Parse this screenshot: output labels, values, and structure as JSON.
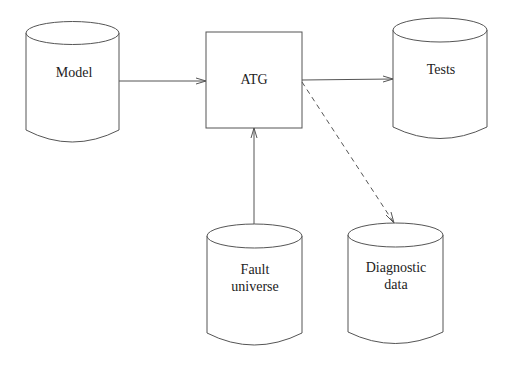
{
  "diagram": {
    "type": "flow-diagram",
    "nodes": [
      {
        "id": "model",
        "shape": "cylinder",
        "lines": [
          "Model"
        ]
      },
      {
        "id": "atg",
        "shape": "rectangle",
        "lines": [
          "ATG"
        ]
      },
      {
        "id": "tests",
        "shape": "cylinder",
        "lines": [
          "Tests"
        ]
      },
      {
        "id": "fault_universe",
        "shape": "cylinder",
        "lines": [
          "Fault",
          "universe"
        ]
      },
      {
        "id": "diagnostic_data",
        "shape": "cylinder",
        "lines": [
          "Diagnostic",
          "data"
        ]
      }
    ],
    "edges": [
      {
        "from": "model",
        "to": "atg",
        "style": "solid"
      },
      {
        "from": "atg",
        "to": "tests",
        "style": "solid"
      },
      {
        "from": "fault_universe",
        "to": "atg",
        "style": "solid"
      },
      {
        "from": "atg",
        "to": "diagnostic_data",
        "style": "dashed"
      }
    ],
    "colors": {
      "stroke": "#555555",
      "text": "#222222",
      "background": "#ffffff"
    }
  },
  "labels": {
    "model": "Model",
    "atg": "ATG",
    "tests": "Tests",
    "fault_line1": "Fault",
    "fault_line2": "universe",
    "diag_line1": "Diagnostic",
    "diag_line2": "data"
  }
}
